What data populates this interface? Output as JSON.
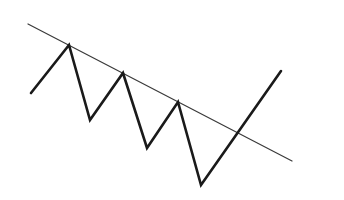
{
  "diagram": {
    "type": "trendline-breakout",
    "background": "#ffffff",
    "trendline": {
      "label": "descending resistance line",
      "color": "#3a3a3a",
      "width": 1.2,
      "points": [
        [
          28,
          24
        ],
        [
          292,
          161
        ]
      ]
    },
    "price_path": {
      "label": "zigzag price movement",
      "color": "#1a1a1a",
      "width": 2.6,
      "points": [
        [
          31,
          93
        ],
        [
          69,
          45
        ],
        [
          90,
          120
        ],
        [
          123,
          73
        ],
        [
          147,
          148
        ],
        [
          178,
          102
        ],
        [
          201,
          185
        ],
        [
          281,
          71
        ]
      ]
    },
    "breakout_point": [
      238,
      133
    ]
  }
}
